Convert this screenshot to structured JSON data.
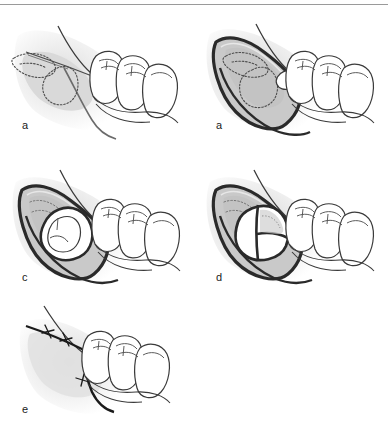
{
  "figure": {
    "background_color": "#ffffff",
    "divider_color": "#9a9a9a",
    "ink_color": "#1a1a1a",
    "tooth_fill": "#ffffff",
    "gum_fill": "#d9d9d9",
    "flap_fill": "#c9c9c9",
    "bone_fill": "#bdbdbd",
    "shadow_fill": "#e3e3e3",
    "dotted_color": "#4d4d4d"
  },
  "panels": [
    {
      "id": "a",
      "label": "a",
      "caption": "Incision outline over the impacted tooth with dotted outline of the unerupted third molar",
      "elements": {
        "incision_line": "incision-line",
        "impacted_tooth_outline": "dotted-tooth-outline",
        "molars": 3,
        "flap_raised": false,
        "bone_window": false,
        "tooth_sectioned": false,
        "sutures": 0
      }
    },
    {
      "id": "b",
      "label": "a",
      "caption": "Mucoperiosteal flap reflected exposing bone over the impacted tooth",
      "elements": {
        "incision_line": "reflected-flap-edge",
        "impacted_tooth_outline": "dotted-tooth-outline",
        "molars": 3,
        "flap_raised": true,
        "bone_window": true,
        "tooth_sectioned": false,
        "sutures": 0
      }
    },
    {
      "id": "c",
      "label": "c",
      "caption": "Bone removed to expose the crown of the impacted third molar",
      "elements": {
        "incision_line": "reflected-flap-edge",
        "impacted_tooth_outline": "exposed-crown",
        "molars": 3,
        "flap_raised": true,
        "bone_window": true,
        "tooth_sectioned": false,
        "sutures": 0
      }
    },
    {
      "id": "d",
      "label": "d",
      "caption": "Tooth sectioned into crown and root segments for removal",
      "elements": {
        "incision_line": "reflected-flap-edge",
        "impacted_tooth_outline": "sectioned-tooth",
        "molars": 3,
        "flap_raised": true,
        "bone_window": true,
        "tooth_sectioned": true,
        "sutures": 0
      }
    },
    {
      "id": "e",
      "label": "e",
      "caption": "Flap repositioned and closed with interrupted sutures",
      "elements": {
        "incision_line": "closed-incision",
        "impacted_tooth_outline": "none",
        "molars": 3,
        "flap_raised": false,
        "bone_window": false,
        "tooth_sectioned": false,
        "sutures": 3
      }
    }
  ]
}
